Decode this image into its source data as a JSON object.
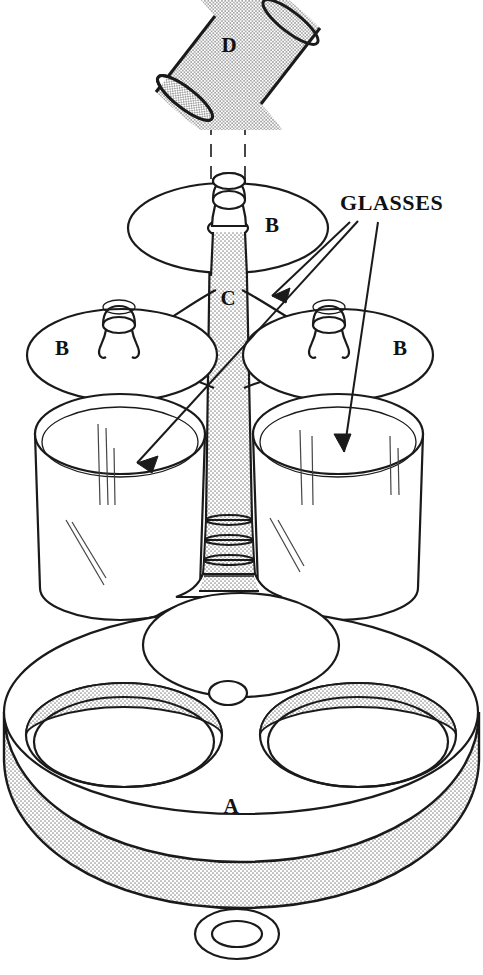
{
  "figure": {
    "kind": "patent-line-drawing",
    "background_color": "#ffffff",
    "line_color": "#1a1a1a",
    "stipple_color": "#b9b9b9"
  },
  "labels": {
    "callout": "GLASSES",
    "part_a": "A",
    "part_b_top": "B",
    "part_b_left": "B",
    "part_b_right": "B",
    "part_c": "C",
    "part_d": "D"
  },
  "parts": [
    {
      "id": "A",
      "name": "base-disc",
      "label": "A",
      "description": "Thick round base platform with stippled rim edge, two large recessed tumbler wells with stippled rims and a small central post hole."
    },
    {
      "id": "B",
      "name": "glass-holder-ring",
      "label": "B",
      "description": "Flat elliptical holder plate carrying a stemmed glass outline; three shown (top, left, right)."
    },
    {
      "id": "C",
      "name": "center-column",
      "label": "C",
      "description": "Stippled tapered central spindle with ring bands near its flared foot."
    },
    {
      "id": "D",
      "name": "handle-rod",
      "label": "D",
      "description": "Detached stippled cylindrical handle rod shown above the assembly, aligned by dashed centre lines."
    }
  ],
  "callouts": [
    {
      "name": "glasses-callout-upper",
      "text": "GLASSES",
      "points_to": "stem glass on upper holder"
    },
    {
      "name": "glasses-callout-left",
      "text": "GLASSES",
      "points_to": "left tumbler"
    },
    {
      "name": "glasses-callout-right",
      "text": "GLASSES",
      "points_to": "right tumbler"
    }
  ],
  "extras": {
    "washer": "small free ring / washer shown detached below the base",
    "centerlines": "two vertical dashed alignment lines from rod D through base A"
  }
}
